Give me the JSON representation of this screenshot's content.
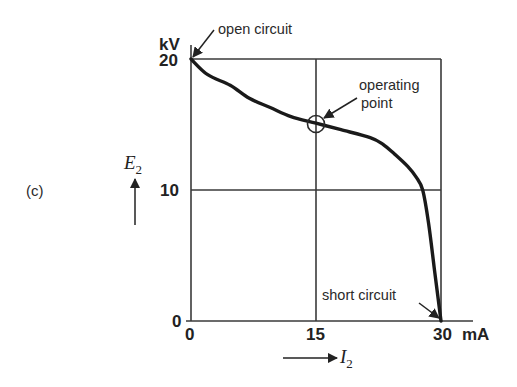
{
  "figure": {
    "panel_label": "(c)",
    "y_unit": "kV",
    "x_unit": "mA",
    "y_symbol": "E",
    "y_subscript": "2",
    "x_symbol": "I",
    "x_subscript": "2",
    "y_ticks": [
      "0",
      "10",
      "20"
    ],
    "x_ticks": [
      "0",
      "15",
      "30"
    ],
    "annotations": {
      "open_circuit": "open circuit",
      "operating_point_line1": "operating",
      "operating_point_line2": "point",
      "short_circuit": "short circuit"
    },
    "colors": {
      "line": "#1a1a1a",
      "grid": "#3a3a3a",
      "text": "#222222"
    }
  },
  "chart_data": {
    "type": "line",
    "title": "",
    "xlabel": "I2 (mA)",
    "ylabel": "E2 (kV)",
    "xlim": [
      0,
      30
    ],
    "ylim": [
      0,
      20
    ],
    "x_ticks": [
      0,
      15,
      30
    ],
    "y_ticks": [
      0,
      10,
      20
    ],
    "grid": true,
    "gridlines": {
      "x": [
        15,
        30
      ],
      "y": [
        10,
        20
      ]
    },
    "series": [
      {
        "name": "E2 vs I2",
        "x": [
          0,
          2,
          4.7,
          7,
          9.5,
          12,
          15,
          18,
          21.5,
          23,
          24.5,
          26,
          27,
          27.8,
          28.5,
          29.2,
          30
        ],
        "y": [
          20,
          18.8,
          18.0,
          17.0,
          16.3,
          15.6,
          15.1,
          14.6,
          14.0,
          13.5,
          12.7,
          11.8,
          11.0,
          10.0,
          7.5,
          4.0,
          0
        ]
      }
    ],
    "annotations": [
      {
        "text": "open circuit",
        "x": 0,
        "y": 20
      },
      {
        "text": "operating point",
        "x": 15,
        "y": 15,
        "marker": "circle"
      },
      {
        "text": "short circuit",
        "x": 30,
        "y": 0
      }
    ],
    "legend": null
  }
}
